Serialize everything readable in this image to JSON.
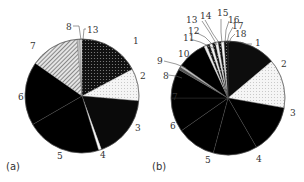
{
  "chart_data": [
    {
      "type": "pie",
      "panel_label": "(a)",
      "center": [
        82,
        96
      ],
      "radius": 57,
      "slices": [
        {
          "label": "1",
          "start": 0,
          "end": 62,
          "fill": "#111111",
          "pattern": "dots-white"
        },
        {
          "label": "2",
          "start": 62,
          "end": 95,
          "fill": "#f4f4f4",
          "pattern": "dots-light"
        },
        {
          "label": "3",
          "start": 95,
          "end": 160,
          "fill": "#0a0a0a",
          "pattern": "none"
        },
        {
          "label": "4",
          "start": 160,
          "end": 163,
          "fill": "#fafafa",
          "pattern": "none"
        },
        {
          "label": "5",
          "start": 163,
          "end": 240,
          "fill": "#6a6a6a",
          "pattern": "check"
        },
        {
          "label": "6",
          "start": 240,
          "end": 305,
          "fill": "#9a9a9a",
          "pattern": "check"
        },
        {
          "label": "7",
          "start": 305,
          "end": 355,
          "fill": "#d0d0d0",
          "pattern": "diag"
        },
        {
          "label": "8",
          "start": 355,
          "end": 358,
          "fill": "#c0c0c0",
          "pattern": "none"
        },
        {
          "label": "13",
          "start": 358,
          "end": 360,
          "fill": "#e0e0e0",
          "pattern": "none"
        }
      ],
      "labels": [
        {
          "text": "1",
          "x": 133,
          "y": 44
        },
        {
          "text": "2",
          "x": 140,
          "y": 79
        },
        {
          "text": "3",
          "x": 135,
          "y": 131
        },
        {
          "text": "4",
          "x": 100,
          "y": 158
        },
        {
          "text": "5",
          "x": 57,
          "y": 159
        },
        {
          "text": "6",
          "x": 18,
          "y": 100
        },
        {
          "text": "7",
          "x": 30,
          "y": 49
        },
        {
          "text": "8",
          "x": 66,
          "y": 30
        },
        {
          "text": "13",
          "x": 87,
          "y": 33
        }
      ],
      "leaders": [
        {
          "points": [
            [
              73,
              26
            ],
            [
              79,
              26
            ],
            [
              81,
              40
            ]
          ]
        },
        {
          "points": [
            [
              86,
              29
            ],
            [
              84,
              29
            ],
            [
              83,
              40
            ]
          ]
        }
      ]
    },
    {
      "type": "pie",
      "panel_label": "(b)",
      "center": [
        228,
        98
      ],
      "radius": 57,
      "slices": [
        {
          "label": "1",
          "start": 0,
          "end": 50,
          "fill": "#0d0d0d",
          "pattern": "none"
        },
        {
          "label": "2",
          "start": 50,
          "end": 100,
          "fill": "#f0f0f0",
          "pattern": "dots-light"
        },
        {
          "label": "3",
          "start": 100,
          "end": 150,
          "fill": "#3a3a3a",
          "pattern": "check"
        },
        {
          "label": "4",
          "start": 150,
          "end": 195,
          "fill": "#cfcfcf",
          "pattern": "check"
        },
        {
          "label": "5",
          "start": 195,
          "end": 235,
          "fill": "#4a4a4a",
          "pattern": "check"
        },
        {
          "label": "6",
          "start": 235,
          "end": 270,
          "fill": "#8a8a8a",
          "pattern": "check"
        },
        {
          "label": "7",
          "start": 270,
          "end": 300,
          "fill": "#b5b5b5",
          "pattern": "check"
        },
        {
          "label": "8",
          "start": 300,
          "end": 303,
          "fill": "#555555",
          "pattern": "none"
        },
        {
          "label": "9",
          "start": 303,
          "end": 305,
          "fill": "#c8c8c8",
          "pattern": "none"
        },
        {
          "label": "10",
          "start": 305,
          "end": 335,
          "fill": "#7a7a7a",
          "pattern": "check"
        },
        {
          "label": "11",
          "start": 335,
          "end": 338,
          "fill": "#eeeeee",
          "pattern": "none"
        },
        {
          "label": "12",
          "start": 338,
          "end": 341,
          "fill": "#222222",
          "pattern": "dots-white"
        },
        {
          "label": "13",
          "start": 341,
          "end": 344,
          "fill": "#f6f6f6",
          "pattern": "none"
        },
        {
          "label": "14",
          "start": 344,
          "end": 347,
          "fill": "#2a2a2a",
          "pattern": "dots-white"
        },
        {
          "label": "15",
          "start": 347,
          "end": 350,
          "fill": "#f4f4f4",
          "pattern": "none"
        },
        {
          "label": "16",
          "start": 350,
          "end": 353,
          "fill": "#333333",
          "pattern": "dots-white"
        },
        {
          "label": "17",
          "start": 353,
          "end": 356,
          "fill": "#f8f8f8",
          "pattern": "none"
        },
        {
          "label": "18",
          "start": 356,
          "end": 360,
          "fill": "#444444",
          "pattern": "dots-white"
        }
      ],
      "labels": [
        {
          "text": "1",
          "x": 255,
          "y": 46
        },
        {
          "text": "2",
          "x": 281,
          "y": 67
        },
        {
          "text": "3",
          "x": 290,
          "y": 116
        },
        {
          "text": "4",
          "x": 256,
          "y": 162
        },
        {
          "text": "5",
          "x": 205,
          "y": 163
        },
        {
          "text": "6",
          "x": 170,
          "y": 129
        },
        {
          "text": "7",
          "x": 172,
          "y": 100
        },
        {
          "text": "8",
          "x": 163,
          "y": 79
        },
        {
          "text": "9",
          "x": 157,
          "y": 64
        },
        {
          "text": "10",
          "x": 178,
          "y": 57
        },
        {
          "text": "11",
          "x": 183,
          "y": 41
        },
        {
          "text": "12",
          "x": 188,
          "y": 34
        },
        {
          "text": "13",
          "x": 186,
          "y": 23
        },
        {
          "text": "14",
          "x": 200,
          "y": 19
        },
        {
          "text": "15",
          "x": 217,
          "y": 16
        },
        {
          "text": "16",
          "x": 228,
          "y": 23
        },
        {
          "text": "17",
          "x": 232,
          "y": 29
        },
        {
          "text": "18",
          "x": 235,
          "y": 37
        }
      ],
      "leaders": [
        {
          "points": [
            [
              252,
              44
            ],
            [
              246,
              44
            ],
            [
              240,
              42
            ]
          ]
        },
        {
          "points": [
            [
              164,
              61
            ],
            [
              176,
              64
            ],
            [
              186,
              68
            ]
          ]
        },
        {
          "points": [
            [
              168,
              75
            ],
            [
              176,
              76
            ],
            [
              182,
              78
            ]
          ]
        },
        {
          "points": [
            [
              190,
              39
            ],
            [
              200,
              42
            ],
            [
              213,
              48
            ]
          ]
        },
        {
          "points": [
            [
              195,
              32
            ],
            [
              205,
              37
            ],
            [
              215,
              47
            ]
          ]
        },
        {
          "points": [
            [
              202,
              21
            ],
            [
              210,
              33
            ],
            [
              217,
              45
            ]
          ]
        },
        {
          "points": [
            [
              205,
              20
            ],
            [
              213,
              34
            ],
            [
              220,
              44
            ]
          ]
        },
        {
          "points": [
            [
              221,
              19
            ],
            [
              221,
              32
            ],
            [
              222,
              43
            ]
          ]
        },
        {
          "points": [
            [
              229,
              21
            ],
            [
              226,
              30
            ],
            [
              225,
              43
            ]
          ]
        },
        {
          "points": [
            [
              233,
              27
            ],
            [
              229,
              34
            ],
            [
              227,
              43
            ]
          ]
        },
        {
          "points": [
            [
              235,
              34
            ],
            [
              231,
              38
            ],
            [
              229,
              43
            ]
          ]
        }
      ]
    }
  ]
}
